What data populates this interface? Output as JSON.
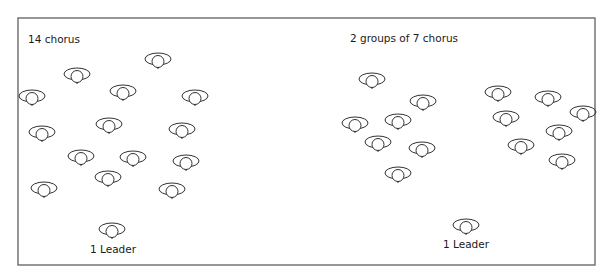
{
  "diagram": {
    "frame": {
      "x": 18,
      "y": 18,
      "width": 577,
      "height": 247,
      "stroke": "#6b6b6b"
    },
    "figure_style": {
      "stroke": "#333333",
      "ellipse_rx": 13,
      "ellipse_ry": 6,
      "head_r": 6
    },
    "panels": [
      {
        "id": "left",
        "title": "14 chorus",
        "title_pos": {
          "x": 28,
          "y": 43
        },
        "chorus": [
          {
            "x": 158,
            "y": 60
          },
          {
            "x": 77,
            "y": 75
          },
          {
            "x": 123,
            "y": 92
          },
          {
            "x": 32,
            "y": 97
          },
          {
            "x": 195,
            "y": 97
          },
          {
            "x": 42,
            "y": 133
          },
          {
            "x": 109,
            "y": 125
          },
          {
            "x": 182,
            "y": 130
          },
          {
            "x": 81,
            "y": 157
          },
          {
            "x": 133,
            "y": 158
          },
          {
            "x": 186,
            "y": 162
          },
          {
            "x": 108,
            "y": 178
          },
          {
            "x": 44,
            "y": 189
          },
          {
            "x": 172,
            "y": 190
          }
        ],
        "leader": {
          "x": 112,
          "y": 230,
          "label": "1 Leader",
          "label_x": 113,
          "label_y": 253
        }
      },
      {
        "id": "right",
        "title": "2 groups of 7 chorus",
        "title_pos": {
          "x": 350,
          "y": 42
        },
        "groups": [
          {
            "name": "group-1",
            "chorus": [
              {
                "x": 372,
                "y": 80
              },
              {
                "x": 423,
                "y": 102
              },
              {
                "x": 355,
                "y": 124
              },
              {
                "x": 398,
                "y": 121
              },
              {
                "x": 378,
                "y": 143
              },
              {
                "x": 422,
                "y": 149
              },
              {
                "x": 398,
                "y": 174
              }
            ]
          },
          {
            "name": "group-2",
            "chorus": [
              {
                "x": 498,
                "y": 93
              },
              {
                "x": 548,
                "y": 98
              },
              {
                "x": 583,
                "y": 113
              },
              {
                "x": 506,
                "y": 118
              },
              {
                "x": 559,
                "y": 132
              },
              {
                "x": 521,
                "y": 146
              },
              {
                "x": 562,
                "y": 161
              }
            ]
          }
        ],
        "leader": {
          "x": 466,
          "y": 226,
          "label": "1 Leader",
          "label_x": 466,
          "label_y": 248
        }
      }
    ]
  }
}
